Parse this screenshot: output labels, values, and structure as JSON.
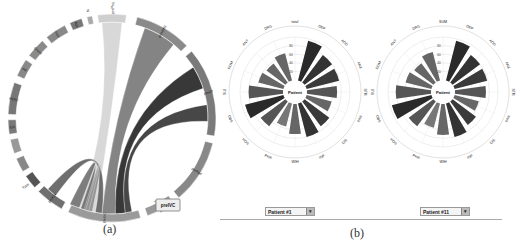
{
  "panel_a": {
    "caption": "(a)",
    "highlight_label": "preIVC",
    "segments": [
      {
        "label": "preProj",
        "start": -8,
        "end": 8,
        "color": "#cfcfcf"
      },
      {
        "label": "preMMG",
        "start": 14,
        "end": 46,
        "color": "#8a8a8a"
      },
      {
        "label": "preRT",
        "start": 50,
        "end": 100,
        "color": "#7a7a7a"
      },
      {
        "label": "preRad",
        "start": 104,
        "end": 140,
        "color": "#888888"
      },
      {
        "label": "preRad2",
        "start": 144,
        "end": 160,
        "color": "#999999"
      },
      {
        "label": "preIVC",
        "start": 164,
        "end": 205,
        "color": "#9a9a9a"
      },
      {
        "label": "preAxx",
        "start": 209,
        "end": 225,
        "color": "#707070"
      },
      {
        "label": "Type",
        "start": 228,
        "end": 236,
        "color": "#555555"
      },
      {
        "label": "",
        "start": 239,
        "end": 247,
        "color": "#888888"
      },
      {
        "label": "",
        "start": 250,
        "end": 258,
        "color": "#999999"
      },
      {
        "label": "ER",
        "start": 261,
        "end": 269,
        "color": "#7a7a7a"
      },
      {
        "label": "HER2",
        "start": 272,
        "end": 290,
        "color": "#777777"
      },
      {
        "label": "PR",
        "start": 294,
        "end": 304,
        "color": "#888888"
      },
      {
        "label": "Grade",
        "start": 307,
        "end": 318,
        "color": "#8a8a8a"
      },
      {
        "label": "Size",
        "start": 321,
        "end": 333,
        "color": "#888888"
      },
      {
        "label": "Age",
        "start": 336,
        "end": 343,
        "color": "#777777"
      },
      {
        "label": "N",
        "start": 346,
        "end": 349,
        "color": "#aaaaaa"
      }
    ]
  },
  "panel_b": {
    "caption": "(b)",
    "charts": [
      {
        "center_label": "Patient",
        "dropdown_value": "Patient #1",
        "axes": [
          "total",
          "DEP",
          "ADD",
          "ANX",
          "STR",
          "PAN",
          "DIS",
          "INP",
          "WIH",
          "PHA",
          "HOS",
          "OBS",
          "SUI",
          "DOM",
          "ANT",
          "DRG"
        ],
        "ring_labels": [
          "80",
          "60",
          "40",
          "20"
        ],
        "values": [
          0,
          95,
          80,
          78,
          70,
          60,
          72,
          80,
          70,
          55,
          72,
          92,
          80,
          60,
          55,
          65
        ],
        "colors": [
          "#333",
          "#2a2a2a",
          "#333",
          "#3a3a3a",
          "#555",
          "#666",
          "#3a3a3a",
          "#333",
          "#666",
          "#777",
          "#555",
          "#2a2a2a",
          "#555",
          "#666",
          "#666",
          "#666"
        ]
      },
      {
        "center_label": "Patient",
        "dropdown_value": "Patient #11",
        "axes": [
          "SUM",
          "DEP",
          "ADD",
          "ANX",
          "STR",
          "PAN",
          "DIS",
          "INP",
          "WIH",
          "PHA",
          "HOS",
          "OBS",
          "SUI",
          "DOM",
          "ANT",
          "DRG"
        ],
        "ring_labels": [
          "80",
          "60",
          "40",
          "20"
        ],
        "values": [
          0,
          95,
          80,
          78,
          72,
          58,
          68,
          80,
          72,
          58,
          72,
          95,
          82,
          62,
          56,
          68
        ],
        "colors": [
          "#333",
          "#2a2a2a",
          "#333",
          "#3a3a3a",
          "#555",
          "#666",
          "#3a3a3a",
          "#333",
          "#666",
          "#777",
          "#555",
          "#2a2a2a",
          "#555",
          "#666",
          "#666",
          "#666"
        ]
      }
    ]
  },
  "chart_data": [
    {
      "type": "chord",
      "title": "(a)",
      "nodes": [
        "preProj",
        "preMMG",
        "preRT",
        "preRad",
        "preRad2",
        "preIVC",
        "preAxx",
        "Type",
        "ER",
        "HER2",
        "PR",
        "Grade",
        "Size",
        "Age",
        "N"
      ],
      "highlighted": "preIVC"
    },
    {
      "type": "bar",
      "subtype": "radial",
      "title": "Patient #1",
      "categories": [
        "total",
        "DEP",
        "ADD",
        "ANX",
        "STR",
        "PAN",
        "DIS",
        "INP",
        "WIH",
        "PHA",
        "HOS",
        "OBS",
        "SUI",
        "DOM",
        "ANT",
        "DRG"
      ],
      "values": [
        0,
        95,
        80,
        78,
        70,
        60,
        72,
        80,
        70,
        55,
        72,
        92,
        80,
        60,
        55,
        65
      ],
      "rings": [
        20,
        40,
        60,
        80
      ],
      "ylim": [
        0,
        100
      ]
    },
    {
      "type": "bar",
      "subtype": "radial",
      "title": "Patient #11",
      "categories": [
        "SUM",
        "DEP",
        "ADD",
        "ANX",
        "STR",
        "PAN",
        "DIS",
        "INP",
        "WIH",
        "PHA",
        "HOS",
        "OBS",
        "SUI",
        "DOM",
        "ANT",
        "DRG"
      ],
      "values": [
        0,
        95,
        80,
        78,
        72,
        58,
        68,
        80,
        72,
        58,
        72,
        95,
        82,
        62,
        56,
        68
      ],
      "rings": [
        20,
        40,
        60,
        80
      ],
      "ylim": [
        0,
        100
      ]
    }
  ]
}
